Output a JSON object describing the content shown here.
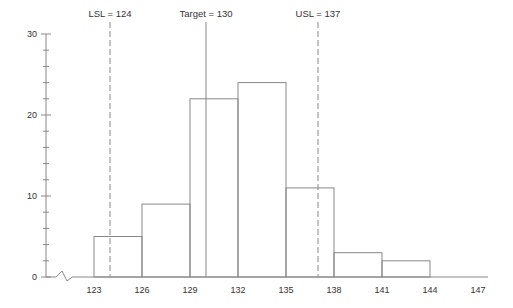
{
  "chart_data": {
    "type": "bar",
    "title": "",
    "xlabel": "",
    "ylabel": "",
    "bin_edges": [
      123,
      126,
      129,
      132,
      135,
      138,
      141,
      144,
      147
    ],
    "x_ticks": [
      "123",
      "126",
      "129",
      "132",
      "135",
      "138",
      "141",
      "144",
      "147"
    ],
    "categories": [
      "123-126",
      "126-129",
      "129-132",
      "132-135",
      "135-138",
      "138-141",
      "141-144",
      "144-147"
    ],
    "values": [
      5,
      9,
      22,
      24,
      11,
      3,
      2,
      0
    ],
    "y_ticks": [
      "0",
      "10",
      "20",
      "30"
    ],
    "y_minor_step": 2,
    "ylim": [
      0,
      30
    ],
    "xlim": [
      123,
      147
    ],
    "axis_break": true,
    "grid": false,
    "legend": "none",
    "annotations": [
      {
        "label": "LSL = 124",
        "x": 124,
        "style": "dashed"
      },
      {
        "label": "Target = 130",
        "x": 130,
        "style": "solid"
      },
      {
        "label": "USL = 137",
        "x": 137,
        "style": "dashed"
      }
    ]
  },
  "colors": {
    "line": "#888888",
    "text": "#333333",
    "background": "#ffffff"
  }
}
